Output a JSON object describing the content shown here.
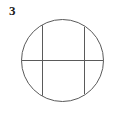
{
  "figure": {
    "label": "3",
    "background_color": "#ffffff",
    "stroke_color": "#5a5a5a",
    "label_color": "#1a1a1a",
    "stroke_width": 1
  },
  "chart_data": {
    "type": "diagram",
    "title": "3",
    "xlabel": "",
    "ylabel": "",
    "xlim": [
      0,
      117
    ],
    "ylim": [
      0,
      116
    ],
    "grid": false,
    "legend": "none",
    "shapes": [
      {
        "name": "circle",
        "kind": "circle",
        "cx": 62.5,
        "cy": 60.5,
        "r": 41.0,
        "fill": "none",
        "stroke": "#5a5a5a"
      },
      {
        "name": "horizontal-diameter",
        "kind": "line",
        "x1": 21.5,
        "y1": 60.5,
        "x2": 103.5,
        "y2": 60.5,
        "stroke": "#5a5a5a"
      },
      {
        "name": "left-vertical-chord",
        "kind": "line",
        "x1": 42.5,
        "y1": 25.3,
        "x2": 42.5,
        "y2": 95.7,
        "stroke": "#5a5a5a"
      },
      {
        "name": "right-vertical-chord",
        "kind": "line",
        "x1": 84.5,
        "y1": 26.9,
        "x2": 84.5,
        "y2": 94.1,
        "stroke": "#5a5a5a"
      }
    ],
    "annotations": [
      {
        "name": "figure-number",
        "text": "3",
        "x": 14,
        "y": 12,
        "bold": true
      }
    ]
  }
}
